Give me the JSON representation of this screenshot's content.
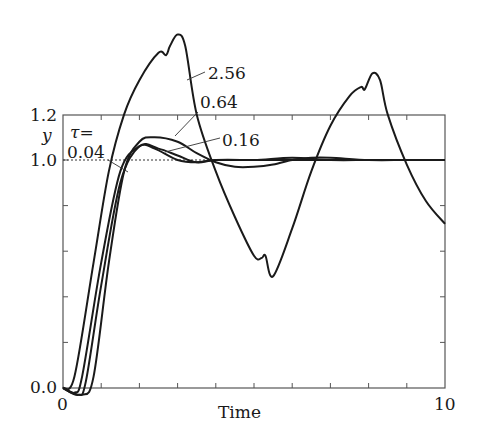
{
  "chart_data": {
    "type": "line",
    "title": "",
    "xlabel": "Time",
    "ylabel": "y",
    "xlim": [
      0,
      10
    ],
    "ylim": [
      0.0,
      1.2
    ],
    "xticks": {
      "labels": [
        "0",
        "10"
      ],
      "minor_step": 1
    },
    "yticks": {
      "labels": [
        "0.0",
        "1.0",
        "1.2"
      ],
      "minor_step": 0.2
    },
    "reference_line": {
      "y": 1.0,
      "style": "dotted"
    },
    "legend_header": "τ=",
    "series": [
      {
        "name": "0.04",
        "x": [
          0,
          0.3,
          0.5,
          1.0,
          1.5,
          2.0,
          2.4,
          3.0,
          3.5,
          4.0,
          5.0,
          6.0,
          7.0,
          8.0,
          9.0,
          10.0
        ],
        "values": [
          0,
          -0.02,
          0.05,
          0.55,
          0.95,
          1.06,
          1.05,
          1.0,
          0.99,
          1.0,
          1.0,
          1.0,
          1.0,
          1.0,
          1.0,
          1.0
        ]
      },
      {
        "name": "0.16",
        "x": [
          0,
          0.4,
          0.6,
          1.0,
          1.5,
          2.0,
          2.5,
          3.0,
          3.5,
          4.0,
          5.0,
          6.0,
          7.0,
          8.0,
          9.0,
          10.0
        ],
        "values": [
          0,
          -0.03,
          0.03,
          0.45,
          0.9,
          1.06,
          1.05,
          1.02,
          0.99,
          1.0,
          1.0,
          1.01,
          1.0,
          1.0,
          1.0,
          1.0
        ]
      },
      {
        "name": "0.64",
        "x": [
          0,
          0.5,
          0.8,
          1.2,
          1.6,
          2.0,
          2.4,
          3.0,
          3.5,
          4.0,
          4.5,
          5.0,
          5.5,
          6.0,
          6.5,
          7.0,
          8.0,
          9.0,
          10.0
        ],
        "values": [
          0,
          -0.03,
          0.05,
          0.55,
          0.95,
          1.08,
          1.1,
          1.08,
          1.03,
          0.99,
          0.97,
          0.97,
          0.98,
          1.0,
          1.01,
          1.01,
          1.0,
          1.0,
          1.0
        ]
      },
      {
        "name": "2.56",
        "x": [
          0,
          0.3,
          0.8,
          1.2,
          1.6,
          2.0,
          2.5,
          2.7,
          2.8,
          3.0,
          3.2,
          3.5,
          4.0,
          4.5,
          5.0,
          5.2,
          5.3,
          5.5,
          6.0,
          6.5,
          7.0,
          7.5,
          7.8,
          7.9,
          8.1,
          8.3,
          8.5,
          9.0,
          9.5,
          10.0
        ],
        "values": [
          0,
          0.05,
          0.55,
          0.95,
          1.2,
          1.35,
          1.47,
          1.46,
          1.5,
          1.55,
          1.5,
          1.2,
          0.95,
          0.75,
          0.58,
          0.57,
          0.58,
          0.49,
          0.7,
          0.95,
          1.15,
          1.28,
          1.32,
          1.31,
          1.38,
          1.35,
          1.2,
          0.98,
          0.82,
          0.72
        ]
      }
    ],
    "annotations": [
      {
        "text": "2.56",
        "x": 5.6,
        "y": 1.38
      },
      {
        "text": "0.64",
        "x": 5.5,
        "y": 1.22
      },
      {
        "text": "0.16",
        "x": 6.2,
        "y": 1.06
      },
      {
        "text": "0.04",
        "x": 0.1,
        "y": 1.02
      },
      {
        "text": "τ=",
        "x": 0.3,
        "y": 1.12
      }
    ],
    "grid": false,
    "legend_position": "inline-labels"
  }
}
